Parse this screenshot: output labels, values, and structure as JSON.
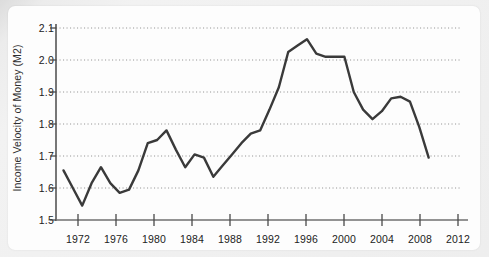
{
  "chart_data": {
    "type": "line",
    "title": "",
    "subtitle": "",
    "xlabel": "",
    "ylabel": "Income Velocity of Money (M2)",
    "xlim": [
      1969.2,
      2013.2
    ],
    "ylim": [
      1.5,
      2.12
    ],
    "grid": true,
    "grid_axis": "y",
    "grid_style": "dotted",
    "legend": false,
    "legend_position": "none",
    "line_color": "#3a3a3a",
    "axis_color": "#555555",
    "plot_background": "#fdfdfd",
    "page_background": "#ececec",
    "xticks": [
      1972,
      1976,
      1980,
      1984,
      1988,
      1992,
      1996,
      2000,
      2004,
      2008,
      2012
    ],
    "xtick_labels": [
      "1972",
      "1976",
      "1980",
      "1984",
      "1988",
      "1992",
      "1996",
      "2000",
      "2004",
      "2008",
      "2012"
    ],
    "yticks": [
      1.5,
      1.6,
      1.7,
      1.8,
      1.9,
      2.0,
      2.1
    ],
    "ytick_labels": [
      "1.5",
      "1.6",
      "1.7",
      "1.8",
      "1.9",
      "2.0",
      "2.1"
    ],
    "series": [
      {
        "name": "Income Velocity of Money (M2)",
        "color": "#3a3a3a",
        "x": [
          1970,
          1971,
          1972,
          1973,
          1974,
          1975,
          1976,
          1977,
          1978,
          1979,
          1980,
          1981,
          1982,
          1983,
          1984,
          1985,
          1986,
          1987,
          1988,
          1989,
          1990,
          1991,
          1992,
          1993,
          1994,
          1995,
          1996,
          1997,
          1998,
          1999,
          2000,
          2001,
          2002,
          2003,
          2004,
          2005,
          2006,
          2007,
          2008,
          2009
        ],
        "values": [
          1.655,
          1.6,
          1.545,
          1.615,
          1.665,
          1.615,
          1.585,
          1.595,
          1.655,
          1.74,
          1.75,
          1.78,
          1.72,
          1.665,
          1.705,
          1.695,
          1.635,
          1.67,
          1.705,
          1.74,
          1.77,
          1.78,
          1.845,
          1.915,
          2.025,
          2.045,
          2.065,
          2.02,
          2.01,
          2.01,
          2.01,
          1.9,
          1.845,
          1.815,
          1.84,
          1.88,
          1.885,
          1.87,
          1.79,
          1.695
        ]
      }
    ]
  },
  "axes": {
    "y_axis_title": "Income Velocity of Money (M2)"
  }
}
